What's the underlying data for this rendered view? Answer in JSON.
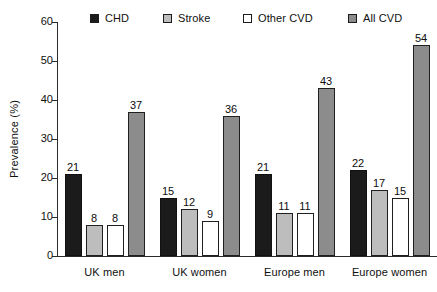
{
  "chart_data": {
    "type": "bar",
    "title": "",
    "xlabel": "",
    "ylabel": "Prevalence (%)",
    "ylim": [
      0,
      60
    ],
    "yticks": [
      0,
      10,
      20,
      30,
      40,
      50,
      60
    ],
    "grid": false,
    "legend_position": "top",
    "categories": [
      "UK men",
      "UK women",
      "Europe men",
      "Europe women"
    ],
    "series": [
      {
        "name": "CHD",
        "values": [
          21,
          15,
          21,
          22
        ],
        "color": "#1b1b1b"
      },
      {
        "name": "Stroke",
        "values": [
          8,
          12,
          11,
          17
        ],
        "color": "#bdbdbd"
      },
      {
        "name": "Other CVD",
        "values": [
          8,
          9,
          11,
          15
        ],
        "color": "#ffffff"
      },
      {
        "name": "All CVD",
        "values": [
          37,
          36,
          43,
          54
        ],
        "color": "#8c8c8c"
      }
    ]
  },
  "axis": {
    "y_title": "Prevalence (%)",
    "tick_labels": [
      "0",
      "10",
      "20",
      "30",
      "40",
      "50",
      "60"
    ]
  },
  "legend": {
    "items": [
      {
        "label": "CHD"
      },
      {
        "label": "Stroke"
      },
      {
        "label": "Other CVD"
      },
      {
        "label": "All CVD"
      }
    ]
  }
}
